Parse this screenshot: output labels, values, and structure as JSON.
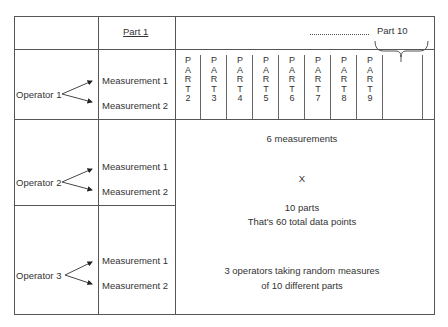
{
  "header": {
    "part_first": "Part 1",
    "part_last": "Part 10",
    "ellipsis": "………………"
  },
  "part_columns": [
    {
      "letters": [
        "P",
        "A",
        "R",
        "T"
      ],
      "number": "2"
    },
    {
      "letters": [
        "P",
        "A",
        "R",
        "T"
      ],
      "number": "3"
    },
    {
      "letters": [
        "P",
        "A",
        "R",
        "T"
      ],
      "number": "4"
    },
    {
      "letters": [
        "P",
        "A",
        "R",
        "T"
      ],
      "number": "5"
    },
    {
      "letters": [
        "P",
        "A",
        "R",
        "T"
      ],
      "number": "6"
    },
    {
      "letters": [
        "P",
        "A",
        "R",
        "T"
      ],
      "number": "7"
    },
    {
      "letters": [
        "P",
        "A",
        "R",
        "T"
      ],
      "number": "8"
    },
    {
      "letters": [
        "P",
        "A",
        "R",
        "T"
      ],
      "number": "9"
    }
  ],
  "operators": [
    {
      "label": "Operator 1",
      "measurements": [
        "Measurement 1",
        "Measurement 2"
      ]
    },
    {
      "label": "Operator 2",
      "measurements": [
        "Measurement 1",
        "Measurement 2"
      ]
    },
    {
      "label": "Operator 3",
      "measurements": [
        "Measurement 1",
        "Measurement 2"
      ]
    }
  ],
  "notes": {
    "line1": "6 measurements",
    "line2": "X",
    "line3": "10 parts",
    "line4": "That's 60 total data points",
    "line5": "3 operators taking random measures",
    "line6": "of 10 different parts"
  },
  "colors": {
    "line": "#555555",
    "text": "#333333"
  }
}
